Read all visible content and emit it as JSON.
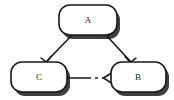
{
  "diagram": {
    "background_color": "#ffffff",
    "node_fill": "#ffffff",
    "node_stroke": "#1a1a1a",
    "shadow_color": "#3a3a3a",
    "edge_color": "#1a1a1a",
    "nodes": [
      {
        "id": "A",
        "label": "A",
        "shape": "rounded-rectangle",
        "x": 59,
        "y": 5,
        "width": 58,
        "height": 30,
        "corner_radius": 11,
        "center_x": 88,
        "center_y": 20
      },
      {
        "id": "C",
        "label": "C",
        "shape": "rounded-rectangle",
        "x": 11,
        "y": 62,
        "width": 56,
        "height": 30,
        "corner_radius": 11,
        "center_x": 39,
        "center_y": 77
      },
      {
        "id": "B",
        "label": "B",
        "shape": "rounded-rectangle",
        "x": 111,
        "y": 62,
        "width": 55,
        "height": 30,
        "corner_radius": 11,
        "center_x": 138,
        "center_y": 77
      }
    ],
    "edges": [
      {
        "id": "edge-a-c",
        "from": "A",
        "to": "C",
        "style": "solid",
        "arrowhead": "open-v",
        "x1": 72,
        "y1": 35,
        "x2": 46,
        "y2": 62
      },
      {
        "id": "edge-a-b",
        "from": "A",
        "to": "B",
        "style": "solid",
        "arrowhead": "open-v",
        "x1": 106,
        "y1": 35,
        "x2": 130,
        "y2": 62
      },
      {
        "id": "edge-c-b",
        "from": "C",
        "to": "B",
        "style": "dashed",
        "arrowhead": "open-v",
        "x1": 67,
        "y1": 78,
        "x2": 111,
        "y2": 78
      }
    ]
  }
}
